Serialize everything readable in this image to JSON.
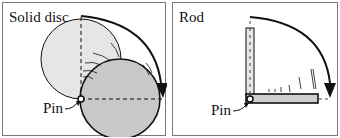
{
  "panels": [
    {
      "title": "Solid disc",
      "pin_label": "Pin"
    },
    {
      "title": "Rod",
      "pin_label": "Pin"
    }
  ],
  "colors": {
    "initial_fill": "#e6e6e6",
    "final_fill": "#c8c8c8",
    "stroke": "#111111",
    "border": "#7a7a7a"
  }
}
